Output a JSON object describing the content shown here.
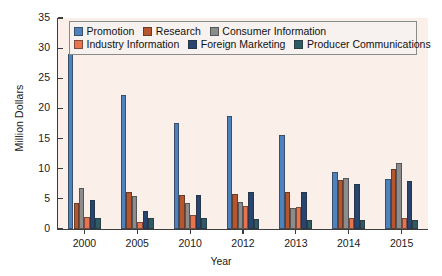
{
  "chart_data": {
    "type": "bar",
    "title": "",
    "xlabel": "Year",
    "ylabel": "Million Dollars",
    "categories": [
      "2000",
      "2005",
      "2010",
      "2012",
      "2013",
      "2014",
      "2015"
    ],
    "ylim": [
      0,
      35
    ],
    "yticks": [
      0,
      5,
      10,
      15,
      20,
      25,
      30,
      35
    ],
    "grid": false,
    "legend_position": "upper-center-inside",
    "plot_background": "#faefe9",
    "series": [
      {
        "name": "Promotion",
        "color": "#4f81bd",
        "values": [
          29.0,
          22.3,
          17.6,
          18.7,
          15.6,
          9.5,
          8.3
        ]
      },
      {
        "name": "Research",
        "color": "#b5562f",
        "values": [
          4.3,
          6.2,
          5.6,
          5.8,
          6.1,
          8.1,
          10.0
        ]
      },
      {
        "name": "Consumer Information",
        "color": "#8c8c8c",
        "values": [
          6.8,
          5.5,
          4.3,
          4.5,
          3.5,
          8.5,
          11.0
        ]
      },
      {
        "name": "Industry Information",
        "color": "#e8744f",
        "values": [
          2.0,
          1.2,
          2.3,
          3.9,
          3.6,
          1.9,
          1.9
        ]
      },
      {
        "name": "Foreign Marketing",
        "color": "#27456f",
        "values": [
          4.8,
          3.0,
          5.6,
          6.2,
          6.1,
          7.5,
          7.9
        ]
      },
      {
        "name": "Producer Communications",
        "color": "#2e5a64",
        "values": [
          1.8,
          1.8,
          1.9,
          1.7,
          1.5,
          1.5,
          1.5
        ]
      }
    ]
  },
  "legend": {
    "rows": [
      [
        {
          "label": "Promotion",
          "color": "#4f81bd"
        },
        {
          "label": "Research",
          "color": "#b5562f"
        },
        {
          "label": "Consumer Information",
          "color": "#8c8c8c"
        }
      ],
      [
        {
          "label": "Industry Information",
          "color": "#e8744f"
        },
        {
          "label": "Foreign Marketing",
          "color": "#27456f"
        },
        {
          "label": "Producer Communications",
          "color": "#2e5a64"
        }
      ]
    ]
  }
}
